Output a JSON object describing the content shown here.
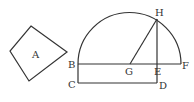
{
  "diagram": {
    "shape_a_label": "A",
    "points": {
      "B": "B",
      "C": "C",
      "D": "D",
      "E": "E",
      "F": "F",
      "G": "G",
      "H": "H"
    },
    "line_color": "#333333"
  }
}
